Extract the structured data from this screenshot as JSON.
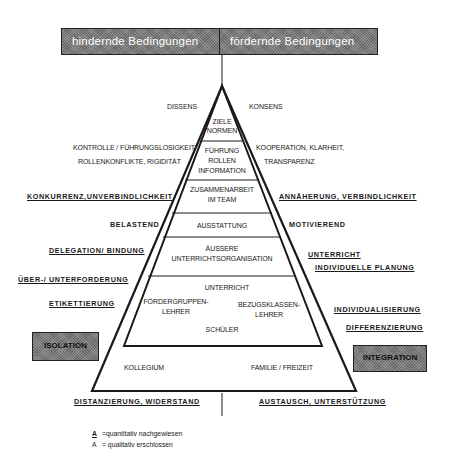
{
  "header": {
    "left_label": "hindernde Bedingungen",
    "right_label": "fördernde Bedingungen"
  },
  "pyramid": {
    "levels": [
      {
        "id": "ziele",
        "lines": [
          "ZIELE",
          "NORMEN"
        ]
      },
      {
        "id": "fuehrung",
        "lines": [
          "FÜHRUNG",
          "ROLLEN",
          "INFORMATION"
        ]
      },
      {
        "id": "zusammenarbeit",
        "lines": [
          "ZUSAMMENARBEIT",
          "IM TEAM"
        ]
      },
      {
        "id": "ausstattung",
        "lines": [
          "AUSSTATTUNG"
        ]
      },
      {
        "id": "organisation",
        "lines": [
          "ÄUSSERE",
          "UNTERRICHTSORGANISATION"
        ]
      },
      {
        "id": "unterricht",
        "title": "UNTERRICHT",
        "left": [
          "FÖRDERGRUPPEN-",
          "LEHRER"
        ],
        "right": [
          "BEZUGSKLASSEN-",
          "LEHRER"
        ],
        "bottom": "SCHÜLER"
      }
    ],
    "base": {
      "left": "KOLLEGIUM",
      "right": "FAMILIE / FREIZEIT"
    }
  },
  "left_side": {
    "dissens": "DISSENS",
    "kontrolle": [
      "KONTROLLE / FÜHRUNGSLOSIGKEIT",
      "ROLLENKONFLIKTE, RIGIDITÄT"
    ],
    "konkurrenz": "KONKURRENZ,UNVERBINDLICHKEIT",
    "belastend": "BELASTEND",
    "delegation": "DELEGATION/  BINDUNG",
    "ueber": "ÜBER-/  UNTERFORDERUNG",
    "etikett": "ETIKETTIERUNG",
    "box": "ISOLATION",
    "bottom": "DISTANZIERUNG,  WIDERSTAND"
  },
  "right_side": {
    "konsens": "KONSENS",
    "kooperation": [
      "KOOPERATION, KLARHEIT,",
      "TRANSPARENZ"
    ],
    "annaeherung": "ANNÄHERUNG,  VERBINDLICHKEIT",
    "motivierend": "MOTIVIEREND",
    "unterricht": "UNTERRICHT",
    "planung": "INDIVIDUELLE  PLANUNG",
    "individualisierung": "INDIVIDUALISIERUNG",
    "differenzierung": "DIFFERENZIERUNG",
    "box": "INTEGRATION",
    "bottom": "AUSTAUSCH,  UNTERSTÜTZUNG"
  },
  "legend": [
    {
      "marker": "A",
      "style": "bold-underlined",
      "text": "=quantitativ  nachgewiesen"
    },
    {
      "marker": "A",
      "style": "plain",
      "text": "= qualitativ  erschlossen"
    }
  ],
  "colors": {
    "box_fill": "#7a7a7a",
    "line": "#1a1a1a"
  }
}
